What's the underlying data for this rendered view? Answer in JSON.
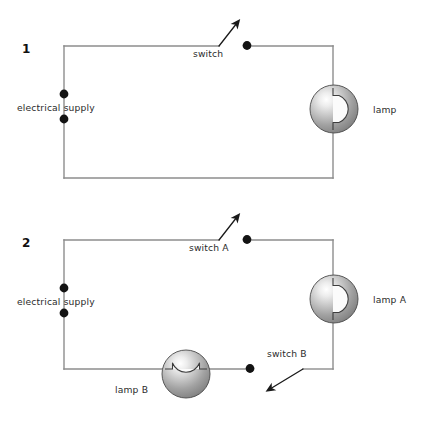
{
  "page": {
    "background_color": "#ffffff",
    "wire_color": "#8d8d8d",
    "label_color": "#2b2b2b",
    "dot_color": "#131313",
    "bulb_color": "#9a9a9a"
  },
  "circuits": [
    {
      "number": "1",
      "labels": {
        "supply": "electrical supply",
        "switch": "switch",
        "lamp": "lamp"
      }
    },
    {
      "number": "2",
      "labels": {
        "supply": "electrical supply",
        "switch_a": "switch A",
        "switch_b": "switch B",
        "lamp_a": "lamp A",
        "lamp_b": "lamp B"
      }
    }
  ]
}
